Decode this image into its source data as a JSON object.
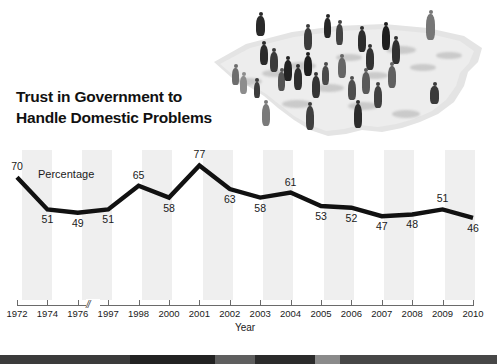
{
  "chart_title": "Trust in Government to Handle Domestic Problems",
  "illustration": {
    "name": "people-on-us-map-photo",
    "description": "Grayscale photo of a crowd of people standing on a silhouette map of the United States"
  },
  "chart_data": {
    "type": "line",
    "title": "Trust in Government to Handle Domestic Problems",
    "xlabel": "Year",
    "ylabel": "Percentage",
    "categories": [
      "1972",
      "1974",
      "1976",
      "1997",
      "1998",
      "2000",
      "2001",
      "2002",
      "2003",
      "2004",
      "2005",
      "2006",
      "2007",
      "2008",
      "2009",
      "2010"
    ],
    "values": [
      70,
      51,
      49,
      51,
      65,
      58,
      77,
      63,
      58,
      61,
      53,
      52,
      47,
      48,
      51,
      46
    ],
    "data_labels": [
      "70",
      "51",
      "49",
      "51",
      "65",
      "58",
      "77",
      "63",
      "58",
      "61",
      "53",
      "52",
      "47",
      "48",
      "51",
      "46"
    ],
    "ylim": [
      40,
      82
    ],
    "grid": false,
    "legend": "none",
    "axis_break": {
      "between": [
        "1976",
        "1997"
      ],
      "symbol": "//"
    },
    "series_color": "#111111",
    "band_color": "#efefef"
  },
  "colors": {
    "line": "#111111",
    "band": "#efefef",
    "axis": "#6a6a6a",
    "text": "#1a1a1a",
    "bottom_bar": "#4a4a4a"
  }
}
